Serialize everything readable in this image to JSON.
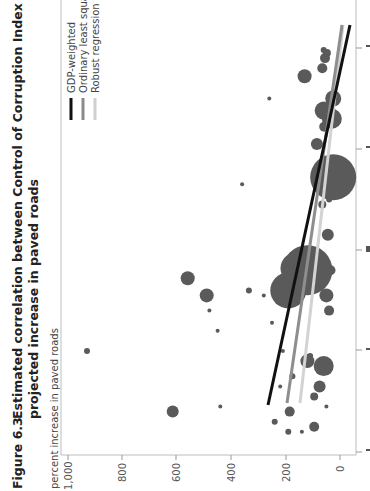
{
  "figure": {
    "label": "Figure 6.3",
    "title_line1": "Estimated correlation between Control of Corruption Index and",
    "title_line2": "projected increase in paved roads",
    "ylabel": "percent increase in paved roads"
  },
  "legend": [
    {
      "label": "GDP-weighted",
      "color": "#111111"
    },
    {
      "label": "Ordinary least squares",
      "color": "#8a8a8a"
    },
    {
      "label": "Robust regression",
      "color": "#cfcfcf"
    }
  ],
  "chart_data": {
    "type": "scatter",
    "title": "Estimated correlation between Control of Corruption Index and projected increase in paved roads",
    "xlabel": "Control of Corruption Index",
    "ylabel": "percent increase in paved roads",
    "rotation": "rotated 90 degrees counter-clockwise on page",
    "y_ticks": [
      "0",
      "200",
      "400",
      "600",
      "800",
      "1,000"
    ],
    "ylim": [
      0,
      1000
    ],
    "x_ticks": [
      -2,
      -1,
      0,
      1,
      2
    ],
    "xlim": [
      -2,
      2.2
    ],
    "grid": false,
    "legend_position": "upper right (top-left in rotated view)",
    "bubble_color": "#555555",
    "points": [
      {
        "x": 1.98,
        "y": 60,
        "r": 3
      },
      {
        "x": 1.95,
        "y": 48,
        "r": 4
      },
      {
        "x": 1.9,
        "y": 55,
        "r": 5
      },
      {
        "x": 1.72,
        "y": 130,
        "r": 7
      },
      {
        "x": 1.8,
        "y": 65,
        "r": 5
      },
      {
        "x": 1.5,
        "y": 25,
        "r": 8
      },
      {
        "x": 1.38,
        "y": 60,
        "r": 9
      },
      {
        "x": 1.3,
        "y": 30,
        "r": 10
      },
      {
        "x": 1.22,
        "y": 58,
        "r": 5
      },
      {
        "x": 1.05,
        "y": 85,
        "r": 6
      },
      {
        "x": 0.72,
        "y": 25,
        "r": 23
      },
      {
        "x": 0.5,
        "y": 40,
        "r": 3
      },
      {
        "x": 0.45,
        "y": 65,
        "r": 4
      },
      {
        "x": 0.15,
        "y": 45,
        "r": 6
      },
      {
        "x": 1.5,
        "y": 260,
        "r": 2
      },
      {
        "x": 0.65,
        "y": 360,
        "r": 2
      },
      {
        "x": 0.55,
        "y": 65,
        "r": 2
      },
      {
        "x": -0.18,
        "y": 160,
        "r": 16
      },
      {
        "x": -0.32,
        "y": 80,
        "r": 3
      },
      {
        "x": -0.2,
        "y": 35,
        "r": 5
      },
      {
        "x": -0.45,
        "y": 50,
        "r": 7
      },
      {
        "x": -0.6,
        "y": 40,
        "r": 5
      },
      {
        "x": -0.4,
        "y": 190,
        "r": 18
      },
      {
        "x": -0.2,
        "y": 120,
        "r": 25
      },
      {
        "x": -0.4,
        "y": 335,
        "r": 3
      },
      {
        "x": -0.45,
        "y": 280,
        "r": 2
      },
      {
        "x": -0.28,
        "y": 560,
        "r": 7
      },
      {
        "x": -0.45,
        "y": 490,
        "r": 7
      },
      {
        "x": -0.6,
        "y": 480,
        "r": 2
      },
      {
        "x": -0.8,
        "y": 450,
        "r": 2
      },
      {
        "x": -0.72,
        "y": 250,
        "r": 2
      },
      {
        "x": -1.0,
        "y": 210,
        "r": 2
      },
      {
        "x": -1.1,
        "y": 120,
        "r": 7
      },
      {
        "x": -1.15,
        "y": 60,
        "r": 10
      },
      {
        "x": -1.05,
        "y": 110,
        "r": 3
      },
      {
        "x": -1.25,
        "y": 175,
        "r": 3
      },
      {
        "x": -1.35,
        "y": 220,
        "r": 2
      },
      {
        "x": -1.0,
        "y": 930,
        "r": 3
      },
      {
        "x": -1.6,
        "y": 615,
        "r": 6
      },
      {
        "x": -1.55,
        "y": 440,
        "r": 2
      },
      {
        "x": -1.6,
        "y": 185,
        "r": 5
      },
      {
        "x": -1.7,
        "y": 240,
        "r": 3
      },
      {
        "x": -1.75,
        "y": 95,
        "r": 5
      },
      {
        "x": -1.45,
        "y": 95,
        "r": 4
      },
      {
        "x": -1.55,
        "y": 50,
        "r": 2
      },
      {
        "x": -1.35,
        "y": 75,
        "r": 6
      },
      {
        "x": -1.8,
        "y": 190,
        "r": 3
      },
      {
        "x": -1.8,
        "y": 140,
        "r": 2
      }
    ],
    "series": [
      {
        "name": "GDP-weighted",
        "type": "line",
        "x": [
          -1.55,
          2.2
        ],
        "y": [
          265,
          -40
        ]
      },
      {
        "name": "Ordinary least squares",
        "type": "line",
        "x": [
          -1.55,
          2.2
        ],
        "y": [
          195,
          0
        ]
      },
      {
        "name": "Robust regression",
        "type": "line",
        "x": [
          -1.55,
          2.2
        ],
        "y": [
          148,
          0
        ]
      }
    ]
  }
}
